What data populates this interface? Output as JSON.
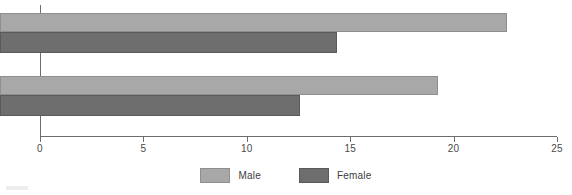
{
  "chart_data": {
    "type": "bar",
    "orientation": "horizontal",
    "title": "",
    "subtitle": "",
    "xlabel": "",
    "ylabel": "",
    "categories": [
      "1987",
      "1995"
    ],
    "series": [
      {
        "name": "Male",
        "values": [
          24.5,
          21.2
        ],
        "color": "#a8a8a8"
      },
      {
        "name": "Female",
        "values": [
          16.3,
          14.5
        ],
        "color": "#6e6e6e"
      }
    ],
    "xlim": [
      0,
      25
    ],
    "xticks": [
      "0",
      "5",
      "10",
      "15",
      "20",
      "25"
    ],
    "xtick_values": [
      0,
      5,
      10,
      15,
      20,
      25
    ],
    "grid": false,
    "legend_position": "bottom"
  },
  "axis": {
    "tick_labels": [
      "0",
      "5",
      "10",
      "15",
      "20",
      "25"
    ],
    "category_labels": [
      "1987",
      "1995"
    ]
  },
  "legend": {
    "items": [
      {
        "label": "Male",
        "color": "#a8a8a8"
      },
      {
        "label": "Female",
        "color": "#6e6e6e"
      }
    ]
  },
  "colors": {
    "male": "#a8a8a8",
    "female": "#6e6e6e",
    "axis": "#6d6d6d",
    "text": "#4a4a4a",
    "background": "#ffffff"
  }
}
